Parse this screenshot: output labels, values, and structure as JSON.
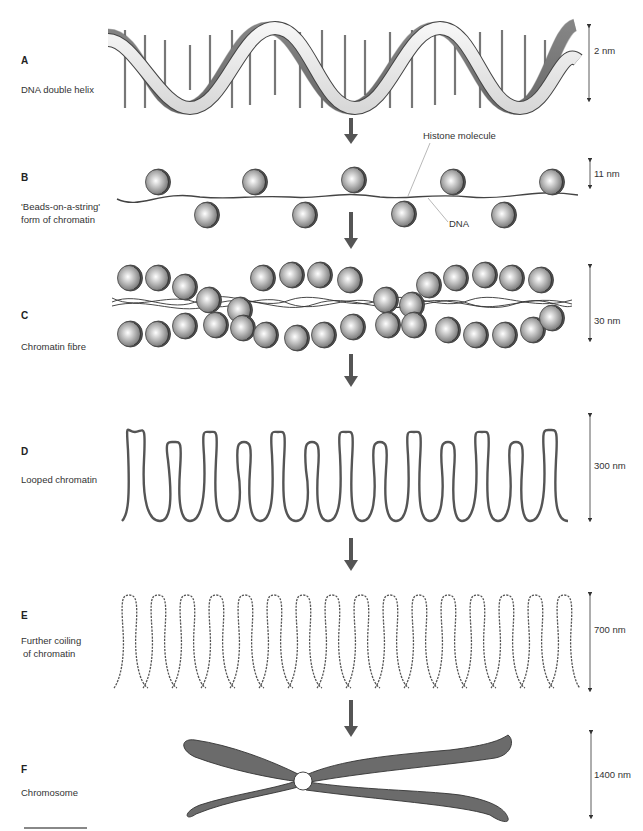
{
  "figure": {
    "stages": [
      {
        "letter": "A",
        "name": "DNA double helix",
        "scale": "2 nm"
      },
      {
        "letter": "B",
        "name": "'Beads-on-a-string' form of chromatin",
        "name_lines": [
          "'Beads-on-a-string'",
          "form of chromatin"
        ],
        "scale": "11 nm"
      },
      {
        "letter": "C",
        "name": "Chromatin fibre",
        "scale": "30 nm"
      },
      {
        "letter": "D",
        "name": "Looped chromatin",
        "scale": "300 nm"
      },
      {
        "letter": "E",
        "name": "Further coiling of chromatin",
        "name_lines": [
          "Further coiling",
          "of chromatin"
        ],
        "scale": "700 nm"
      },
      {
        "letter": "F",
        "name": "Chromosome",
        "scale": "1400 nm"
      }
    ],
    "callouts": {
      "histone": "Histone molecule",
      "dna": "DNA"
    },
    "colors": {
      "arrow": "#555555",
      "bead_fill": "#b5b5b5",
      "bead_edge": "#444444",
      "strand": "#555555",
      "chromosome_fill": "#6b6b6b",
      "helix_light": "#eeeeee",
      "helix_dark": "#9a9a9a"
    }
  }
}
